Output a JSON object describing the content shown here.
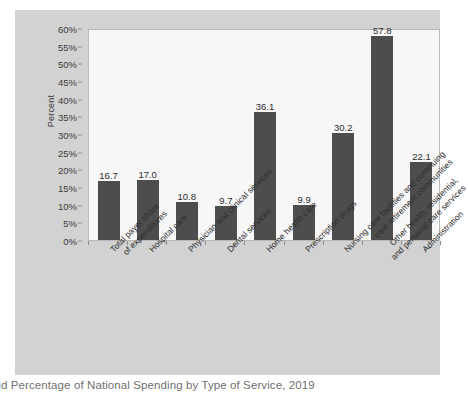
{
  "caption": "caid Percentage of National Spending by Type of Service, 2019",
  "colors": {
    "bar": "#4d4d4d",
    "panel": "#d2d2d2",
    "plot": "#f7f7f7",
    "axis": "#8d8d8d",
    "text": "#2d2d2d",
    "caption": "#6f6f6f"
  },
  "chart_data": {
    "type": "bar",
    "title": "",
    "xlabel": "",
    "ylabel": "Percent",
    "ylim": [
      0,
      60
    ],
    "ytick_step": 5,
    "ytick_labels": [
      "0%",
      "5%",
      "10%",
      "15%",
      "20%",
      "25%",
      "30%",
      "35%",
      "40%",
      "45%",
      "50%",
      "55%",
      "60%"
    ],
    "ytick_values": [
      0,
      5,
      10,
      15,
      20,
      25,
      30,
      35,
      40,
      45,
      50,
      55,
      60
    ],
    "grid": false,
    "legend": "none",
    "label_rotation": -45,
    "categories": [
      "Total payer share\nof expenditures",
      "Hospital care",
      "Physician and clinical services",
      "Dental services",
      "Home health care",
      "Prescription drugs",
      "Nursing care facilities and continuing\ncare retirement communities",
      "Other health, residential,\nand personal care services",
      "Administration"
    ],
    "values": [
      16.7,
      17.0,
      10.8,
      9.7,
      36.1,
      9.9,
      30.2,
      57.8,
      22.1
    ],
    "value_labels": [
      "16.7",
      "17.0",
      "10.8",
      "9.7",
      "36.1",
      "9.9",
      "30.2",
      "57.8",
      "22.1"
    ]
  }
}
